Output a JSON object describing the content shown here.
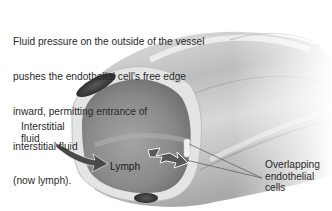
{
  "figure": {
    "labels": {
      "caption_lines": [
        "Fluid pressure on the outside of the vessel",
        "pushes the endothelial cell's free edge",
        "inward, permitting entrance of",
        "interstitial fluid",
        "(now lymph)."
      ],
      "interstitial_fluid": "Interstitial\nfluid",
      "lymph": "Lymph",
      "overlapping_cells": "Overlapping\nendothelial\ncells"
    },
    "colors": {
      "background": "#ffffff",
      "vessel_outer": "#cfcfcf",
      "vessel_highlight": "#eeeeee",
      "lumen": "#8e8e8e",
      "lumen_dark": "#6f6f6f",
      "wall": "#e6e6e6",
      "nucleus": "#3a3a3a",
      "arrow": "#4a4a4a",
      "leader_line": "#555555",
      "text": "#2b2b2b"
    }
  }
}
